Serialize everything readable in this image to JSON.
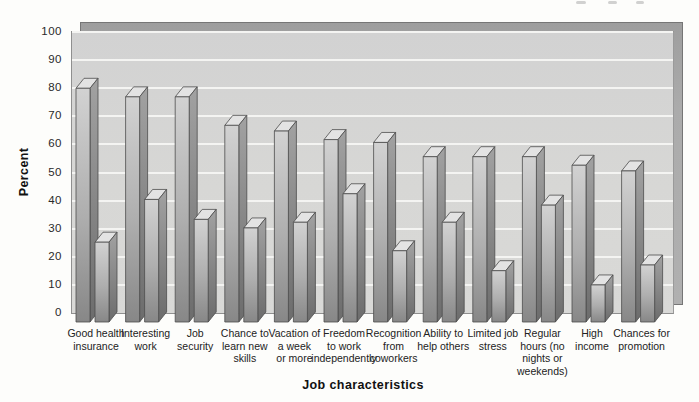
{
  "chart_data": {
    "type": "bar",
    "variant": "3d-column, two unlabeled bars per category",
    "title": "",
    "xlabel": "Job characteristics",
    "ylabel": "Percent",
    "ylim": [
      0,
      100
    ],
    "yticks": [
      0,
      10,
      20,
      30,
      40,
      50,
      60,
      70,
      80,
      90,
      100
    ],
    "grid": "horizontal white gridlines every 10",
    "legend": "none",
    "categories": [
      "Good health insurance",
      "Interesting work",
      "Job security",
      "Chance to learn new skills",
      "Vacation of a week or more",
      "Freedom to work independently",
      "Recognition from coworkers",
      "Ability to help others",
      "Limited job stress",
      "Regular hours (no nights or weekends)",
      "High income",
      "Chances for promotion"
    ],
    "category_label_lines": [
      [
        "Good health",
        "insurance"
      ],
      [
        "Interesting",
        "work"
      ],
      [
        "Job",
        "security"
      ],
      [
        "Chance to",
        "learn new",
        "skills"
      ],
      [
        "Vacation of",
        "a week",
        "or more"
      ],
      [
        "Freedom",
        "to work",
        "independently"
      ],
      [
        "Recognition",
        "from",
        "coworkers"
      ],
      [
        "Ability to",
        "help others"
      ],
      [
        "Limited job",
        "stress"
      ],
      [
        "Regular",
        "hours (no",
        "nights or",
        "weekends)"
      ],
      [
        "High",
        "income"
      ],
      [
        "Chances for",
        "promotion"
      ]
    ],
    "series": [
      {
        "name": "series-1",
        "values": [
          82,
          79,
          79,
          69,
          67,
          64,
          63,
          58,
          58,
          58,
          55,
          53
        ]
      },
      {
        "name": "series-2",
        "values": [
          28,
          43,
          36,
          33,
          35,
          45,
          25,
          35,
          18,
          41,
          13,
          20
        ]
      }
    ]
  },
  "colors": {
    "page_background": "#fdfdfb",
    "wall": "#d5d5d4",
    "backdrop_band": "#aaaaaa",
    "gridline": "#f4f4f2",
    "bar_front_top": "#d2d2d2",
    "bar_front_bottom": "#878787",
    "bar_side_top": "#a2a2a2",
    "bar_side_bottom": "#6c6c6c",
    "bar_top_face": "#e3e3e3",
    "bar_outline": "#4d4d4d",
    "text": "#1f1f1f"
  }
}
